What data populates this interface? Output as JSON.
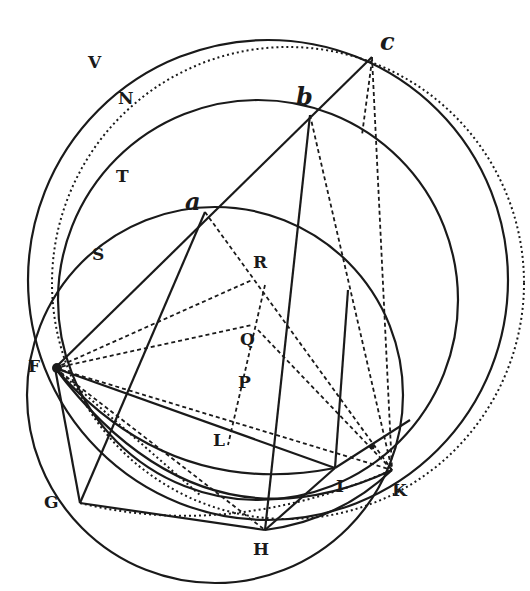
{
  "diagram": {
    "type": "geometric-construction",
    "ink_color": "#1a1a1a",
    "background": "#ffffff",
    "points": {
      "V": {
        "label": "V",
        "x": 88,
        "y": 68,
        "style": "roman"
      },
      "N": {
        "label": "N",
        "x": 118,
        "y": 104,
        "style": "roman"
      },
      "T": {
        "label": "T",
        "x": 116,
        "y": 182,
        "style": "roman"
      },
      "S": {
        "label": "S",
        "x": 92,
        "y": 260,
        "style": "roman"
      },
      "F": {
        "label": "F",
        "x": 28,
        "y": 372,
        "style": "roman"
      },
      "G": {
        "label": "G",
        "x": 44,
        "y": 508,
        "style": "roman"
      },
      "H": {
        "label": "H",
        "x": 253,
        "y": 555,
        "style": "roman"
      },
      "I": {
        "label": "I",
        "x": 336,
        "y": 492,
        "style": "roman"
      },
      "K": {
        "label": "K",
        "x": 392,
        "y": 496,
        "style": "roman"
      },
      "L": {
        "label": "L",
        "x": 213,
        "y": 446,
        "style": "roman"
      },
      "P": {
        "label": "P",
        "x": 238,
        "y": 388,
        "style": "roman"
      },
      "Q": {
        "label": "Q",
        "x": 240,
        "y": 345,
        "style": "roman"
      },
      "R": {
        "label": "R",
        "x": 253,
        "y": 268,
        "style": "roman"
      },
      "a": {
        "label": "a",
        "x": 185,
        "y": 210,
        "style": "italic"
      },
      "b": {
        "label": "b",
        "x": 296,
        "y": 105,
        "style": "italic"
      },
      "c": {
        "label": "c",
        "x": 380,
        "y": 50,
        "style": "italic"
      }
    }
  }
}
